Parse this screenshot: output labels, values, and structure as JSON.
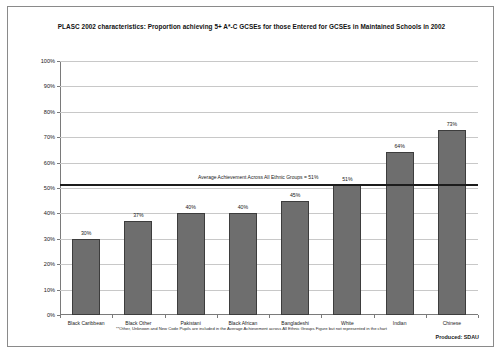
{
  "chart_data": {
    "type": "bar",
    "title": "PLASC 2002 characteristics: Proportion achieving 5+ A*-C GCSEs for those Entered for GCSEs in Maintained Schools in 2002",
    "xlabel": "",
    "ylabel": "",
    "ylim": [
      0,
      100
    ],
    "grid": true,
    "legend": "none",
    "categories": [
      "Black Caribbean",
      "Black Other",
      "Pakistani",
      "Black African",
      "Bangladeshi",
      "White",
      "Indian",
      "Chinese"
    ],
    "values": [
      30,
      37,
      40,
      40,
      45,
      51,
      64,
      73
    ],
    "value_labels": [
      "30%",
      "37%",
      "40%",
      "40%",
      "45%",
      "51%",
      "64%",
      "73%"
    ],
    "ytick_labels": [
      "100%",
      "90%",
      "80%",
      "70%",
      "60%",
      "50%",
      "40%",
      "30%",
      "20%",
      "10%",
      "0%"
    ],
    "ytick_values": [
      100,
      90,
      80,
      70,
      60,
      50,
      40,
      30,
      20,
      10,
      0
    ],
    "bar_color": "#6e6e6e",
    "bar_border_color": "#3d3d3d",
    "gridline_color": "#c8c8c8",
    "annotations": [
      {
        "name": "average-achievement-line",
        "text": "Average Achievement Across All Ethnic Groups = 51%",
        "value": 51,
        "color": "#1c1c1c"
      }
    ]
  },
  "footnote": "**Other, Unknown and New Code Pupils are included in the Average Achievement across All Ethnic Groups Figure but not represented in the chart",
  "produced_by": "Produced: SDAU"
}
